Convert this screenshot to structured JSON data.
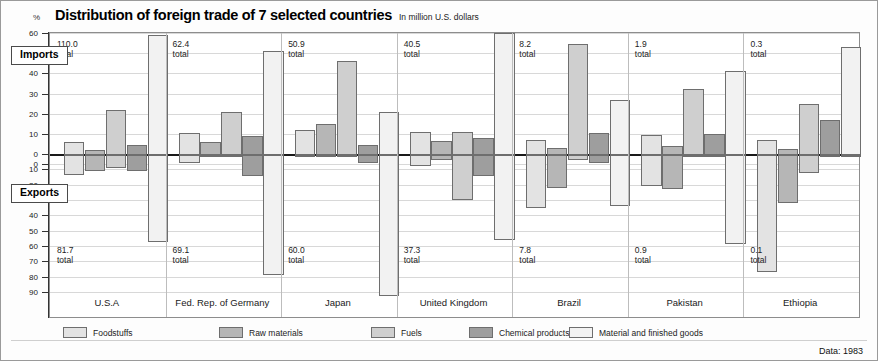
{
  "header": {
    "percent_symbol": "%",
    "title": "Distribution of foreign trade of 7 selected countries",
    "subtitle": "In million U.S. dollars"
  },
  "callouts": {
    "imports": "Imports",
    "exports": "Exports"
  },
  "footer": {
    "source": "Data: 1983"
  },
  "legend": [
    {
      "label": "Foodstuffs",
      "color": "#e3e3e3"
    },
    {
      "label": "Raw materials",
      "color": "#b6b6b6"
    },
    {
      "label": "Fuels",
      "color": "#cfcfcf"
    },
    {
      "label": "Chemical products",
      "color": "#9e9e9e"
    },
    {
      "label": "Material and finished goods",
      "color": "#f2f2f2"
    }
  ],
  "chart_data": {
    "type": "bar",
    "title": "Distribution of foreign trade of 7 selected countries",
    "subtitle": "In million U.S. dollars",
    "ylabel": "%",
    "xlabel": "",
    "orientation": "vertical",
    "layout": "grouped diverging (imports above zero, exports below zero)",
    "grid": true,
    "legend_position": "bottom",
    "upper_axis_ticks": [
      60,
      50,
      40,
      30,
      20,
      10,
      0
    ],
    "lower_axis_ticks": [
      0,
      10,
      20,
      30,
      40,
      50,
      60,
      70,
      80,
      90
    ],
    "ylim_imports": [
      0,
      60
    ],
    "ylim_exports": [
      0,
      90
    ],
    "series_names": [
      "Foodstuffs",
      "Raw materials",
      "Fuels",
      "Chemical products",
      "Material and finished goods"
    ],
    "categories": [
      "U.S.A",
      "Fed. Rep. of Germany",
      "Japan",
      "United Kingdom",
      "Brazil",
      "Pakistan",
      "Ethiopia"
    ],
    "import_totals": [
      "110.0",
      "62.4",
      "50.9",
      "40.5",
      "8.2",
      "1.9",
      "0.3"
    ],
    "export_totals": [
      "81.7",
      "69.1",
      "60.0",
      "37.3",
      "7.8",
      "0.9",
      "0.1"
    ],
    "total_suffix": "total",
    "imports": [
      {
        "country": "U.S.A",
        "total": 110.0,
        "values": [
          6.5,
          2.5,
          22.5,
          5.0,
          59.5
        ]
      },
      {
        "country": "Fed. Rep. of Germany",
        "total": 62.4,
        "values": [
          11.0,
          6.5,
          21.5,
          9.5,
          51.5
        ]
      },
      {
        "country": "Japan",
        "total": 50.9,
        "values": [
          12.5,
          15.5,
          46.5,
          5.0,
          21.5
        ]
      },
      {
        "country": "United Kingdom",
        "total": 40.5,
        "values": [
          11.5,
          7.0,
          11.5,
          8.5,
          60.5
        ]
      },
      {
        "country": "Brazil",
        "total": 8.2,
        "values": [
          7.5,
          3.5,
          55.0,
          11.0,
          27.5
        ]
      },
      {
        "country": "Pakistan",
        "total": 1.9,
        "values": [
          10.0,
          4.5,
          32.5,
          10.5,
          41.5
        ]
      },
      {
        "country": "Ethiopia",
        "total": 0.3,
        "values": [
          7.5,
          3.0,
          25.5,
          17.5,
          53.5
        ]
      }
    ],
    "exports": [
      {
        "country": "U.S.A",
        "total": 81.7,
        "values": [
          13.0,
          10.5,
          8.5,
          10.5,
          56.5
        ]
      },
      {
        "country": "Fed. Rep. of Germany",
        "total": 69.1,
        "values": [
          5.0,
          1.5,
          1.5,
          13.5,
          78.5
        ]
      },
      {
        "country": "Japan",
        "total": 60.0,
        "values": [
          1.0,
          0.8,
          0.8,
          5.0,
          92.0
        ]
      },
      {
        "country": "United Kingdom",
        "total": 37.3,
        "values": [
          7.0,
          3.0,
          29.5,
          14.0,
          55.5
        ]
      },
      {
        "country": "Brazil",
        "total": 7.8,
        "values": [
          34.5,
          21.5,
          3.5,
          5.5,
          33.5
        ]
      },
      {
        "country": "Pakistan",
        "total": 0.9,
        "values": [
          20.5,
          22.0,
          1.0,
          1.0,
          58.0
        ]
      },
      {
        "country": "Ethiopia",
        "total": 0.1,
        "values": [
          76.0,
          31.5,
          12.0,
          0.5,
          0.5
        ]
      }
    ]
  }
}
